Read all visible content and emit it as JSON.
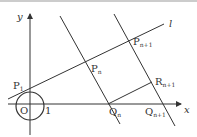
{
  "diagram": {
    "axes": {
      "x_label": "x",
      "y_label": "y",
      "origin_label": "O",
      "unit_label": "1"
    },
    "line_label": "l",
    "points": [
      {
        "id": "P1",
        "base": "P",
        "sub": "1"
      },
      {
        "id": "Pn",
        "base": "P",
        "sub": "n"
      },
      {
        "id": "Pn1",
        "base": "P",
        "sub": "n+1"
      },
      {
        "id": "Qn",
        "base": "Q",
        "sub": "n"
      },
      {
        "id": "Qn1",
        "base": "Q",
        "sub": "n+1"
      },
      {
        "id": "Rn1",
        "base": "R",
        "sub": "n+1"
      }
    ],
    "colors": {
      "stroke": "#333333",
      "background": "#ffffff"
    }
  }
}
